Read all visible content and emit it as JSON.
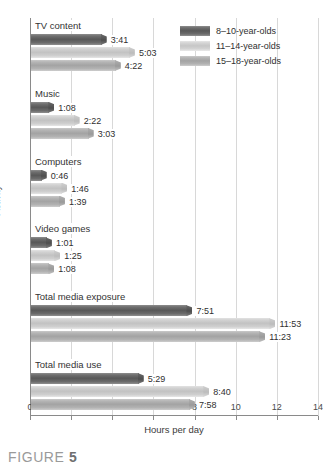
{
  "caption": {
    "prefix": "FIGURE",
    "number": "5"
  },
  "legend": {
    "position": "top-right",
    "items": [
      {
        "label": "8–10-year-olds",
        "color": "#585858"
      },
      {
        "label": "11–14-year-olds",
        "color": "#c6c6c6"
      },
      {
        "label": "15–18-year-olds",
        "color": "#a3a3a3"
      }
    ]
  },
  "chart_data": {
    "type": "bar",
    "orientation": "horizontal",
    "title": "",
    "xlabel": "Hours per day",
    "ylabel": "Activity",
    "xlim": [
      0,
      14
    ],
    "xticks": [
      "0",
      "2",
      "4",
      "6",
      "8",
      "10",
      "12",
      "14"
    ],
    "grid": true,
    "categories": [
      "TV content",
      "Music",
      "Computers",
      "Video games",
      "Total media exposure",
      "Total media use"
    ],
    "series": [
      {
        "name": "8–10-year-olds",
        "labels": [
          "3:41",
          "1:08",
          "0:46",
          "1:01",
          "7:51",
          "5:29"
        ],
        "values": [
          3.683,
          1.133,
          0.767,
          1.017,
          7.85,
          5.483
        ]
      },
      {
        "name": "11–14-year-olds",
        "labels": [
          "5:03",
          "2:22",
          "1:46",
          "1:25",
          "11:53",
          "8:40"
        ],
        "values": [
          5.05,
          2.367,
          1.767,
          1.417,
          11.883,
          8.667
        ]
      },
      {
        "name": "15–18-year-olds",
        "labels": [
          "4:22",
          "3:03",
          "1:39",
          "1:08",
          "11:23",
          "7:58"
        ],
        "values": [
          4.367,
          3.05,
          1.65,
          1.133,
          11.383,
          7.967
        ]
      }
    ]
  }
}
